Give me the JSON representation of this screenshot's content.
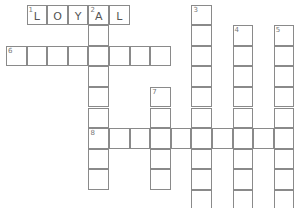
{
  "puzzle": {
    "grid": {
      "origin_x": 6,
      "origin_y": 4.5,
      "cell_size": 20.6,
      "border_color": "#8a8a8a"
    },
    "entries": [
      {
        "number": "1",
        "direction": "across",
        "row": 0,
        "col": 1,
        "length": 5,
        "letters": [
          "L",
          "O",
          "Y",
          "A",
          "L"
        ]
      },
      {
        "number": "2",
        "direction": "down",
        "row": 0,
        "col": 4,
        "length": 9,
        "letters": [
          "A",
          "",
          "",
          "",
          "",
          "",
          "",
          "",
          ""
        ]
      },
      {
        "number": "3",
        "direction": "down",
        "row": 0,
        "col": 9,
        "length": 10,
        "letters": []
      },
      {
        "number": "4",
        "direction": "down",
        "row": 1,
        "col": 11,
        "length": 9,
        "letters": []
      },
      {
        "number": "5",
        "direction": "down",
        "row": 1,
        "col": 13,
        "length": 9,
        "letters": []
      },
      {
        "number": "6",
        "direction": "across",
        "row": 2,
        "col": 0,
        "length": 8,
        "letters": []
      },
      {
        "number": "7",
        "direction": "down",
        "row": 4,
        "col": 7,
        "length": 5,
        "letters": []
      },
      {
        "number": "8",
        "direction": "across",
        "row": 6,
        "col": 4,
        "length": 10,
        "letters": []
      }
    ]
  }
}
